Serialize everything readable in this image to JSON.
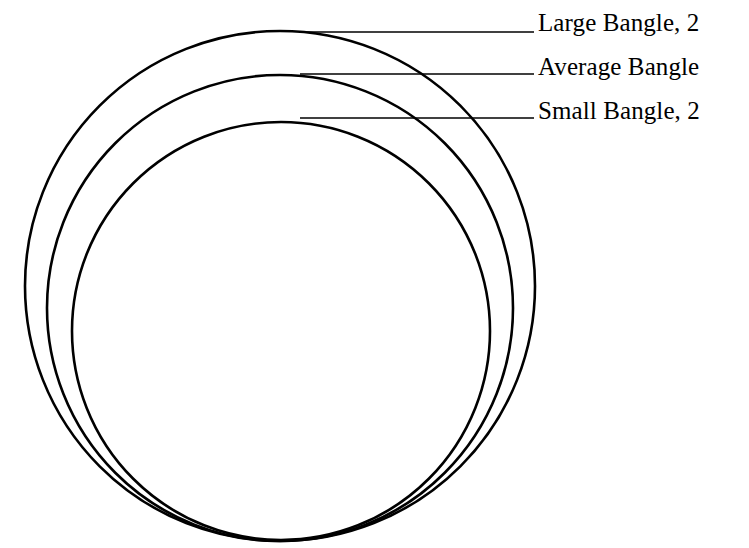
{
  "figure": {
    "background_color": "#ffffff",
    "stroke_color": "#000000",
    "canvas": {
      "width": 749,
      "height": 548
    }
  },
  "chart_data": {
    "type": "diagram",
    "subtype": "nested-concentric-circles",
    "title": "",
    "units": "px",
    "grid": false,
    "legend_position": "right",
    "series": [
      {
        "name": "Large Bangle",
        "label": "Large Bangle, 2",
        "label_clipped": true,
        "center": [
          280,
          286
        ],
        "radius": 255,
        "bbox": {
          "left": 25,
          "top": 31,
          "right": 535,
          "bottom": 541
        },
        "leader": {
          "x1": 303,
          "y1": 32,
          "x2": 534,
          "y2": 32
        },
        "stroke_width": 2.6
      },
      {
        "name": "Average Bangle",
        "label": "Average Bangle",
        "label_clipped": true,
        "center": [
          280,
          308
        ],
        "radius": 233,
        "bbox": {
          "left": 47,
          "top": 75,
          "right": 513,
          "bottom": 541
        },
        "leader": {
          "x1": 300,
          "y1": 74,
          "x2": 534,
          "y2": 74
        },
        "stroke_width": 2.6
      },
      {
        "name": "Small Bangle",
        "label": "Small Bangle, 2",
        "label_clipped": true,
        "center": [
          281,
          331
        ],
        "radius": 209,
        "bbox": {
          "left": 72,
          "top": 122,
          "right": 490,
          "bottom": 540
        },
        "leader": {
          "x1": 300,
          "y1": 118,
          "x2": 534,
          "y2": 118
        },
        "stroke_width": 2.6
      }
    ],
    "labels": [
      "Large Bangle, 2",
      "Average Bangle",
      "Small Bangle, 2"
    ]
  },
  "legend": {
    "large": {
      "text": "Large Bangle, 2"
    },
    "average": {
      "text": "Average Bangle"
    },
    "small": {
      "text": "Small Bangle, 2"
    }
  }
}
